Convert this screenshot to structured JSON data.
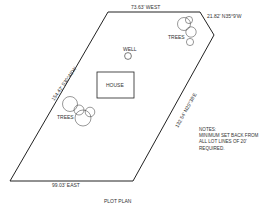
{
  "diagram": {
    "title": "PLOT PLAN",
    "boundary_labels": {
      "north": "73.63' WEST",
      "northeast": "21.82' N35°9'W",
      "west": "154.42' S30°48'W",
      "east": "132.54' N29°38'E",
      "south": "99.03' EAST"
    },
    "features": {
      "house": "HOUSE",
      "well": "WELL",
      "trees_northeast": "TREES",
      "trees_west": "TREES"
    },
    "notes": {
      "heading": "NOTES:",
      "lines": [
        "MINIMUM SET BACK FROM",
        "ALL LOT LINES OF 20'",
        "REQUIRED."
      ]
    },
    "colors": {
      "line": "#222222",
      "text": "#333333",
      "background": "#ffffff"
    }
  }
}
